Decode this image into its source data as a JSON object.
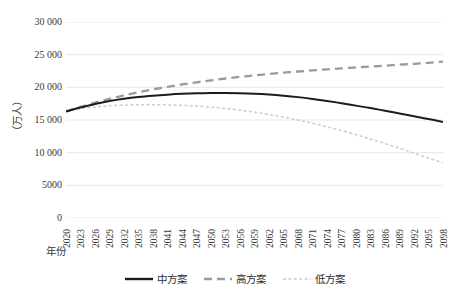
{
  "chart_data": {
    "type": "line",
    "title": "",
    "xlabel": "年份",
    "ylabel": "（万人）",
    "ylim": [
      0,
      30000
    ],
    "yticks": [
      "0",
      "5000",
      "10 000",
      "15 000",
      "20 000",
      "25 000",
      "30 000"
    ],
    "ytick_values": [
      0,
      5000,
      10000,
      15000,
      20000,
      25000,
      30000
    ],
    "grid": true,
    "legend_position": "bottom",
    "x": [
      2020,
      2023,
      2026,
      2029,
      2032,
      2035,
      2038,
      2041,
      2044,
      2047,
      2050,
      2053,
      2056,
      2059,
      2062,
      2065,
      2068,
      2071,
      2074,
      2077,
      2080,
      2083,
      2086,
      2089,
      2092,
      2095,
      2098
    ],
    "categories": [
      "2020",
      "2023",
      "2026",
      "2029",
      "2032",
      "2035",
      "2038",
      "2041",
      "2044",
      "2047",
      "2050",
      "2053",
      "2056",
      "2059",
      "2062",
      "2065",
      "2068",
      "2071",
      "2074",
      "2077",
      "2080",
      "2083",
      "2086",
      "2089",
      "2092",
      "2095",
      "2098"
    ],
    "series": [
      {
        "name": "中方案",
        "style": "solid",
        "color": "#1c1c1c",
        "values": [
          16300,
          16900,
          17450,
          17900,
          18250,
          18520,
          18720,
          18880,
          19000,
          19080,
          19120,
          19130,
          19100,
          19030,
          18900,
          18720,
          18500,
          18230,
          17920,
          17570,
          17200,
          16820,
          16420,
          16000,
          15580,
          15150,
          14700
        ]
      },
      {
        "name": "高方案",
        "style": "dashed",
        "color": "#9a9a9a",
        "values": [
          16300,
          17000,
          17650,
          18230,
          18760,
          19250,
          19680,
          20080,
          20440,
          20770,
          21070,
          21350,
          21600,
          21830,
          22040,
          22240,
          22420,
          22590,
          22750,
          22900,
          23040,
          23180,
          23320,
          23460,
          23600,
          23750,
          23950
        ]
      },
      {
        "name": "低方案",
        "style": "dotted",
        "color": "#cccccc",
        "values": [
          16300,
          16720,
          17000,
          17180,
          17280,
          17330,
          17340,
          17310,
          17240,
          17130,
          16970,
          16760,
          16500,
          16200,
          15850,
          15450,
          15000,
          14500,
          13960,
          13380,
          12760,
          12100,
          11400,
          10680,
          9930,
          9180,
          8450
        ]
      }
    ]
  },
  "legend": {
    "items": [
      {
        "label": "中方案",
        "style": "solid",
        "color": "#1c1c1c"
      },
      {
        "label": "高方案",
        "style": "dashed",
        "color": "#9a9a9a"
      },
      {
        "label": "低方案",
        "style": "dotted",
        "color": "#cccccc"
      }
    ]
  },
  "axes": {
    "y_title": "（万人）",
    "x_title": "年份"
  }
}
